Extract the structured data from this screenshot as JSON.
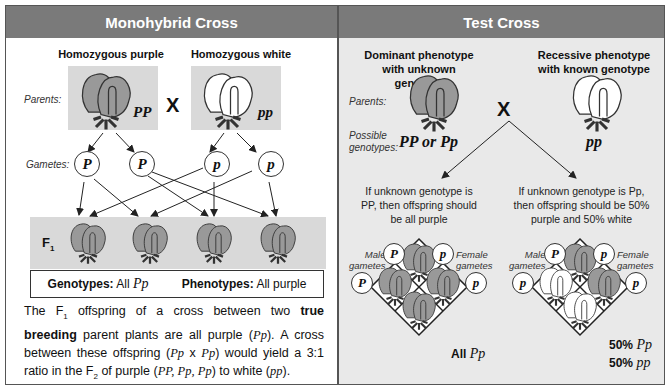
{
  "monohybrid": {
    "title": "Monohybrid Cross",
    "parent1_label": "Homozygous purple",
    "parent2_label": "Homozygous white",
    "parents_label": "Parents:",
    "parent1_genotype": "PP",
    "parent2_genotype": "pp",
    "cross_symbol": "X",
    "gametes_label": "Gametes:",
    "gametes": [
      "P",
      "P",
      "p",
      "p"
    ],
    "f1_label": "F",
    "f1_sub": "1",
    "genotypes_label": "Genotypes:",
    "genotypes_prefix": "All",
    "genotypes_value": "Pp",
    "phenotypes_label": "Phenotypes:",
    "phenotypes_value": "All purple",
    "description": {
      "p1": "The F",
      "sub1": "1",
      "p2": " offspring of a cross between two ",
      "bold": "true breeding",
      "p3": " parent plants are all purple (",
      "g1": "Pp",
      "p4": "). A cross between these offspring (",
      "g2": "Pp",
      "p5": " x ",
      "g3": "Pp",
      "p6": ") would yield a  3:1 ratio in the F",
      "sub2": "2",
      "p7": " of purple (",
      "g4": "PP, Pp, Pp",
      "p8": ") to white (",
      "g5": "pp",
      "p9": ")."
    }
  },
  "testcross": {
    "title": "Test Cross",
    "left_label_1": "Dominant phenotype",
    "left_label_2": "with unknown genotype",
    "right_label_1": "Recessive phenotype",
    "right_label_2": "with known genotype",
    "parents_label": "Parents:",
    "possible_label_1": "Possible",
    "possible_label_2": "genotypes:",
    "left_genotype": "PP or Pp",
    "right_genotype": "pp",
    "cross_symbol": "X",
    "outcome_left": [
      "If unknown genotype is",
      "PP, then offspring should",
      "be all purple"
    ],
    "outcome_right": [
      "If unknown genotype is Pp,",
      "then offspring should be 50%",
      "purple and 50% white"
    ],
    "male_label": [
      "Male",
      "gametes"
    ],
    "female_label": [
      "Female",
      "gametes"
    ],
    "square_left": {
      "male_gametes": [
        "P",
        "P"
      ],
      "female_gametes": [
        "p",
        "p"
      ],
      "result_prefix": "All",
      "result_genotype": "Pp"
    },
    "square_right": {
      "male_gametes": [
        "P",
        "p"
      ],
      "female_gametes": [
        "p",
        "p"
      ],
      "result1_prefix": "50%",
      "result1_genotype": "Pp",
      "result2_prefix": "50%",
      "result2_genotype": "pp"
    }
  },
  "colors": {
    "header_bg": "#7a7a7a",
    "purple_flower": "#999999",
    "white_flower": "#ffffff",
    "shade_box": "#d9d9d9",
    "right_panel_bg": "#e9e9e9"
  }
}
